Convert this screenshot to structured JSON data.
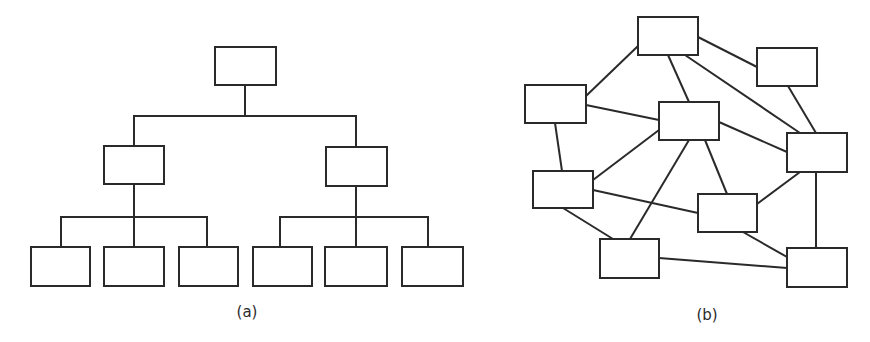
{
  "colors": {
    "stroke": "#2a2a2a",
    "fill": "#ffffff",
    "background": "#ffffff"
  },
  "diagrams": [
    {
      "id": "a",
      "type": "hierarchy-tree",
      "caption": "(a)",
      "caption_pos": [
        247,
        303
      ],
      "nodes": [
        {
          "id": "root",
          "x": 215,
          "y": 47,
          "w": 61,
          "h": 38
        },
        {
          "id": "L",
          "x": 104,
          "y": 146,
          "w": 60,
          "h": 38
        },
        {
          "id": "R",
          "x": 326,
          "y": 147,
          "w": 61,
          "h": 39
        },
        {
          "id": "L1",
          "x": 31,
          "y": 247,
          "w": 59,
          "h": 39
        },
        {
          "id": "L2",
          "x": 104,
          "y": 247,
          "w": 60,
          "h": 39
        },
        {
          "id": "L3",
          "x": 179,
          "y": 247,
          "w": 59,
          "h": 39
        },
        {
          "id": "R1",
          "x": 253,
          "y": 247,
          "w": 59,
          "h": 39
        },
        {
          "id": "R2",
          "x": 325,
          "y": 247,
          "w": 62,
          "h": 39
        },
        {
          "id": "R3",
          "x": 402,
          "y": 247,
          "w": 61,
          "h": 39
        }
      ],
      "connectors": [
        [
          [
            245,
            85
          ],
          [
            245,
            116
          ]
        ],
        [
          [
            134,
            116
          ],
          [
            356,
            116
          ]
        ],
        [
          [
            134,
            116
          ],
          [
            134,
            146
          ]
        ],
        [
          [
            356,
            116
          ],
          [
            356,
            147
          ]
        ],
        [
          [
            134,
            184
          ],
          [
            134,
            217
          ]
        ],
        [
          [
            61,
            217
          ],
          [
            207,
            217
          ]
        ],
        [
          [
            61,
            217
          ],
          [
            61,
            247
          ]
        ],
        [
          [
            134,
            217
          ],
          [
            134,
            247
          ]
        ],
        [
          [
            207,
            217
          ],
          [
            207,
            247
          ]
        ],
        [
          [
            356,
            186
          ],
          [
            356,
            217
          ]
        ],
        [
          [
            280,
            217
          ],
          [
            428,
            217
          ]
        ],
        [
          [
            280,
            217
          ],
          [
            280,
            247
          ]
        ],
        [
          [
            356,
            217
          ],
          [
            356,
            247
          ]
        ],
        [
          [
            428,
            217
          ],
          [
            428,
            247
          ]
        ]
      ]
    },
    {
      "id": "b",
      "type": "network-graph",
      "caption": "(b)",
      "caption_pos": [
        707,
        306
      ],
      "nodes": [
        {
          "id": "N1",
          "x": 638,
          "y": 17,
          "w": 60,
          "h": 38
        },
        {
          "id": "N2",
          "x": 757,
          "y": 48,
          "w": 60,
          "h": 38
        },
        {
          "id": "N3",
          "x": 525,
          "y": 85,
          "w": 61,
          "h": 38
        },
        {
          "id": "N4",
          "x": 659,
          "y": 102,
          "w": 60,
          "h": 38
        },
        {
          "id": "N5",
          "x": 787,
          "y": 133,
          "w": 60,
          "h": 39
        },
        {
          "id": "N6",
          "x": 533,
          "y": 171,
          "w": 60,
          "h": 37
        },
        {
          "id": "N7",
          "x": 698,
          "y": 194,
          "w": 59,
          "h": 38
        },
        {
          "id": "N8",
          "x": 600,
          "y": 239,
          "w": 59,
          "h": 39
        },
        {
          "id": "N9",
          "x": 787,
          "y": 248,
          "w": 60,
          "h": 39
        }
      ],
      "edges": [
        {
          "from": "N1",
          "to": "N3",
          "pts": [
            638,
            46,
            586,
            96
          ]
        },
        {
          "from": "N1",
          "to": "N2",
          "pts": [
            698,
            37,
            757,
            67
          ]
        },
        {
          "from": "N1",
          "to": "N4",
          "pts": [
            668,
            55,
            689,
            102
          ]
        },
        {
          "from": "N1",
          "to": "N5",
          "pts": [
            685,
            55,
            800,
            133
          ]
        },
        {
          "from": "N2",
          "to": "N5",
          "pts": [
            788,
            86,
            816,
            133
          ]
        },
        {
          "from": "N3",
          "to": "N4",
          "pts": [
            586,
            105,
            659,
            120
          ]
        },
        {
          "from": "N3",
          "to": "N6",
          "pts": [
            555,
            123,
            562,
            171
          ]
        },
        {
          "from": "N4",
          "to": "N5",
          "pts": [
            719,
            122,
            787,
            152
          ]
        },
        {
          "from": "N4",
          "to": "N6",
          "pts": [
            659,
            130,
            593,
            180
          ]
        },
        {
          "from": "N4",
          "to": "N8",
          "pts": [
            689,
            140,
            630,
            239
          ]
        },
        {
          "from": "N4",
          "to": "N7",
          "pts": [
            705,
            140,
            727,
            194
          ]
        },
        {
          "from": "N5",
          "to": "N7",
          "pts": [
            800,
            172,
            757,
            204
          ]
        },
        {
          "from": "N5",
          "to": "N9",
          "pts": [
            816,
            172,
            816,
            248
          ]
        },
        {
          "from": "N6",
          "to": "N7",
          "pts": [
            593,
            190,
            698,
            213
          ]
        },
        {
          "from": "N6",
          "to": "N8",
          "pts": [
            563,
            208,
            613,
            239
          ]
        },
        {
          "from": "N7",
          "to": "N9",
          "pts": [
            743,
            232,
            787,
            257
          ]
        },
        {
          "from": "N8",
          "to": "N9",
          "pts": [
            659,
            258,
            787,
            268
          ]
        }
      ]
    }
  ]
}
